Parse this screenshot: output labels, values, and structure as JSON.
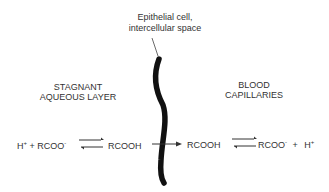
{
  "membrane_label": {
    "line1": "Epithelial cell,",
    "line2": "intercellular space"
  },
  "left_region": {
    "line1": "STAGNANT",
    "line2": "AQUEOUS LAYER"
  },
  "right_region": {
    "line1": "BLOOD",
    "line2": "CAPILLARIES"
  },
  "left_equation": {
    "proton": "H",
    "proton_charge": "+",
    "plus": "+",
    "anion": "RCOO",
    "anion_charge": "-",
    "acid": "RCOOH"
  },
  "right_equation": {
    "acid": "RCOOH",
    "anion": "RCOO",
    "anion_charge": "-",
    "plus": "+",
    "proton": "H",
    "proton_charge": "+"
  },
  "colors": {
    "ink": "#333333",
    "membrane": "#111111",
    "background": "#ffffff"
  }
}
